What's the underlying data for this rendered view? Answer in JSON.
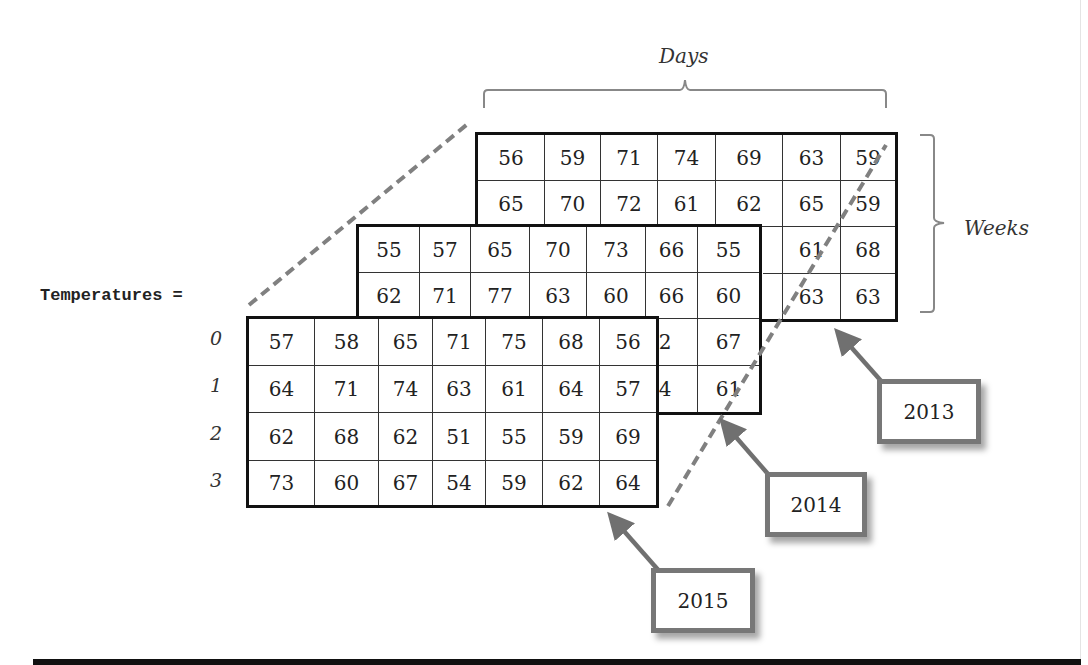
{
  "diagram": {
    "variable_label": "Temperatures =",
    "axis_labels": {
      "days": "Days",
      "weeks": "Weeks"
    },
    "row_indices": [
      "0",
      "1",
      "2",
      "3"
    ],
    "callouts": {
      "y2013": "2013",
      "y2014": "2014",
      "y2015": "2015"
    },
    "colors": {
      "grid_border": "#111111",
      "dashed_line": "#808080",
      "callout_border": "#777777",
      "arrow": "#707070"
    }
  },
  "arrays": {
    "y2013": [
      [
        "56",
        "59",
        "71",
        "74",
        "69",
        "63",
        "59"
      ],
      [
        "65",
        "70",
        "72",
        "61",
        "62",
        "65",
        "59"
      ],
      [
        "",
        "",
        "",
        "",
        "",
        "61",
        "68"
      ],
      [
        "",
        "",
        "",
        "",
        "",
        "63",
        "63"
      ]
    ],
    "y2014": [
      [
        "55",
        "57",
        "65",
        "70",
        "73",
        "66",
        "55"
      ],
      [
        "62",
        "71",
        "77",
        "63",
        "60",
        "66",
        "60"
      ],
      [
        "",
        "",
        "",
        "",
        "",
        "62",
        "67"
      ],
      [
        "",
        "",
        "",
        "",
        "",
        "64",
        "61"
      ]
    ],
    "y2015": [
      [
        "57",
        "58",
        "65",
        "71",
        "75",
        "68",
        "56"
      ],
      [
        "64",
        "71",
        "74",
        "63",
        "61",
        "64",
        "57"
      ],
      [
        "62",
        "68",
        "62",
        "51",
        "55",
        "59",
        "69"
      ],
      [
        "73",
        "60",
        "67",
        "54",
        "59",
        "62",
        "64"
      ]
    ]
  }
}
